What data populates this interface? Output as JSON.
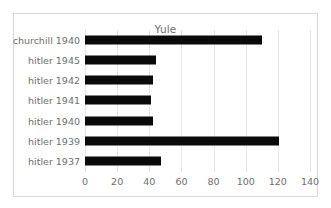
{
  "figure": {
    "title": "Yule",
    "background_color": "#ffffff",
    "border_color": "#d9d9d9",
    "bar_color": "#0a0a0a",
    "text_color": "#6e6e6e",
    "gridline_color": "#e8e8e8"
  },
  "chart_data": {
    "type": "bar",
    "orientation": "horizontal",
    "title": "Yule",
    "xlabel": "",
    "ylabel": "",
    "categories": [
      "churchill 1940",
      "hitler 1945",
      "hitler 1942",
      "hitler 1941",
      "hitler 1940",
      "hitler 1939",
      "hitler 1937"
    ],
    "values": [
      110,
      44,
      42,
      41,
      42,
      121,
      47
    ],
    "xlim": [
      0,
      140
    ],
    "xticks": [
      0,
      20,
      40,
      60,
      80,
      100,
      120,
      140
    ],
    "xtick_labels": [
      "0",
      "20",
      "40",
      "60",
      "80",
      "100",
      "120",
      "140"
    ],
    "grid": true,
    "grid_axis": "x",
    "legend": false
  }
}
